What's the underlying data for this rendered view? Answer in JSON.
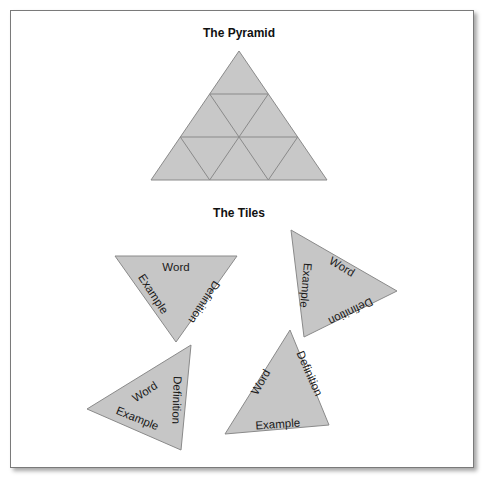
{
  "pyramid": {
    "title": "The Pyramid",
    "fill": "#c8c8c8",
    "stroke": "#8a8a8a",
    "apex": [
      239,
      51
    ],
    "base_left": [
      151,
      180
    ],
    "base_right": [
      327,
      180
    ],
    "rows": 3,
    "triangle_count": 9
  },
  "tiles_section": {
    "title": "The Tiles",
    "fill": "#c6c6c6",
    "stroke": "#8a8a8a",
    "tiles": [
      {
        "word": "Word",
        "definition": "Definition",
        "example": "Example"
      },
      {
        "word": "Word",
        "definition": "Definition",
        "example": "Example"
      },
      {
        "word": "Word",
        "definition": "Definition",
        "example": "Example"
      },
      {
        "word": "Word",
        "definition": "Definition",
        "example": "Example"
      }
    ]
  }
}
